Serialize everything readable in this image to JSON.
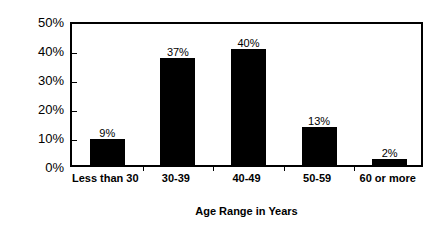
{
  "chart_data": {
    "type": "bar",
    "title": "",
    "subtitle": "",
    "categories": [
      "Less than 30",
      "30-39",
      "40-49",
      "50-59",
      "60 or more"
    ],
    "values": [
      9,
      37,
      40,
      13,
      2
    ],
    "data_labels": [
      "9%",
      "37%",
      "40%",
      "13%",
      "2%"
    ],
    "xlabel": "Age Range in Years",
    "ylabel": "Percent",
    "ylim": [
      0,
      50
    ],
    "ytick_values": [
      0,
      10,
      20,
      30,
      40,
      50
    ],
    "ytick_labels": [
      "0%",
      "10%",
      "20%",
      "30%",
      "40%",
      "50%"
    ],
    "grid": false,
    "legend": null,
    "legend_position": "none",
    "bar_color": "#000000",
    "bar_edge_color": "#000000",
    "axis_color": "#000000",
    "background_color": "#FFFFFF",
    "annotations": []
  }
}
